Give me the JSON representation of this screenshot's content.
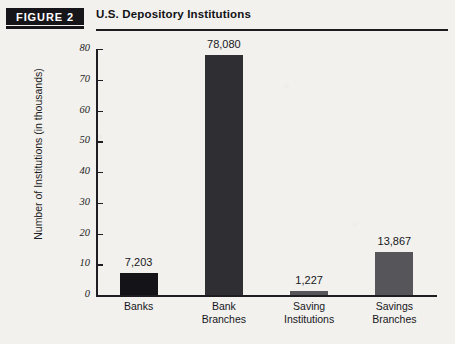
{
  "figure": {
    "badge_label": "FIGURE 2",
    "title": "U.S. Depository Institutions"
  },
  "chart_data": {
    "type": "bar",
    "title": "U.S. Depository Institutions",
    "xlabel": "",
    "ylabel": "Number of Institutions (in thousands)",
    "categories": [
      "Banks",
      "Bank Branches",
      "Saving Institutions",
      "Savings Branches"
    ],
    "category_lines": [
      [
        "Banks"
      ],
      [
        "Bank",
        "Branches"
      ],
      [
        "Saving",
        "Institutions"
      ],
      [
        "Savings",
        "Branches"
      ]
    ],
    "values": [
      7203,
      78080,
      1227,
      13867
    ],
    "values_thousands": [
      7.203,
      78.08,
      1.227,
      13.867
    ],
    "data_labels": [
      "7,203",
      "78,080",
      "1,227",
      "13,867"
    ],
    "bar_colors": [
      "#141418",
      "#2f2f33",
      "#56565a",
      "#55555a"
    ],
    "ylim": [
      0,
      80
    ],
    "yticks": [
      0,
      10,
      20,
      30,
      40,
      50,
      60,
      70,
      80
    ],
    "ytick_labels": [
      "0",
      "10",
      "20",
      "30",
      "40",
      "50",
      "60",
      "70",
      "80"
    ],
    "grid": false,
    "legend": "none"
  },
  "colors": {
    "page_background": "#f2f1ee",
    "ink": "#1d1d22",
    "badge_background": "#16161a",
    "badge_text": "#ffffff"
  }
}
